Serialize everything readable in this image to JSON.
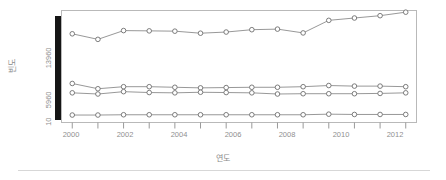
{
  "figure": {
    "background": "#ffffff",
    "frame_color": "#b9b9b9",
    "line_color": "#8c8c8c",
    "marker_fill": "#ffffff",
    "marker_stroke": "#6e6e6e",
    "axis_color": "#9a9a9a",
    "rule_color": "#d7d7d7"
  },
  "chart_data": {
    "type": "line",
    "title": "",
    "subtitle": "",
    "xlabel": "연도",
    "ylabel": "빈도",
    "x": [
      2000,
      2001,
      2002,
      2003,
      2004,
      2005,
      2006,
      2007,
      2008,
      2009,
      2010,
      2011,
      2012,
      2013
    ],
    "xlim": [
      1999.6,
      2013.4
    ],
    "ylim": [
      10,
      19000
    ],
    "xticks": [
      2000,
      2001,
      2002,
      2003,
      2004,
      2005,
      2006,
      2007,
      2008,
      2009,
      2010,
      2011,
      2012,
      2013
    ],
    "xtick_labels": [
      "2000",
      "",
      "2002",
      "",
      "2004",
      "",
      "2006",
      "",
      "2008",
      "",
      "2010",
      "",
      "2012",
      ""
    ],
    "yticks": [
      10,
      5960,
      13960
    ],
    "ytick_labels": [
      "10",
      "5960",
      "13960"
    ],
    "grid": false,
    "legend": "none",
    "series": [
      {
        "name": "series-1",
        "marker": "open-circle",
        "values": [
          15100,
          14150,
          15650,
          15600,
          15550,
          15200,
          15400,
          15800,
          15900,
          15250,
          17400,
          17800,
          18200,
          18800
        ]
      },
      {
        "name": "series-2",
        "marker": "open-circle",
        "values": [
          6600,
          5700,
          6050,
          6050,
          5950,
          5850,
          5900,
          5950,
          5950,
          6050,
          6250,
          6150,
          6150,
          6050
        ]
      },
      {
        "name": "series-3",
        "marker": "open-circle",
        "values": [
          5000,
          4800,
          5200,
          5050,
          5000,
          5100,
          5050,
          5000,
          4800,
          4850,
          4850,
          4850,
          4900,
          5000
        ]
      },
      {
        "name": "series-4",
        "marker": "open-circle",
        "values": [
          1200,
          1200,
          1250,
          1250,
          1250,
          1250,
          1250,
          1250,
          1250,
          1250,
          1350,
          1300,
          1300,
          1300
        ]
      }
    ]
  }
}
